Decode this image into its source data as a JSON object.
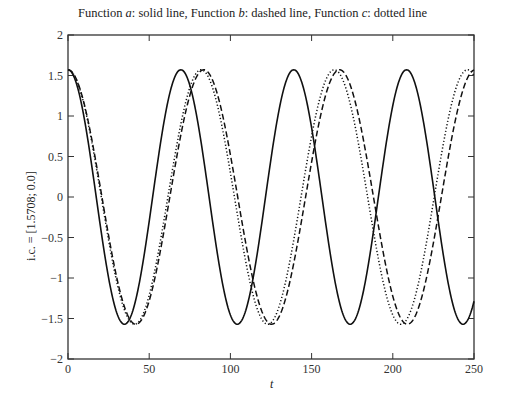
{
  "chart_data": {
    "type": "line",
    "title": "Function a: solid line, Function b: dashed line, Function c: dotted line",
    "title_parts": [
      "Function ",
      "a",
      ": solid line, Function ",
      "b",
      ": dashed line, Function ",
      "c",
      ": dotted line"
    ],
    "xlabel": "t",
    "ylabel": "i.c. = [1.5708; 0.0]",
    "xlim": [
      0,
      250
    ],
    "ylim": [
      -2,
      2
    ],
    "xticks": [
      0,
      50,
      100,
      150,
      200,
      250
    ],
    "yticks": [
      -2,
      -1.5,
      -1,
      -0.5,
      0,
      0.5,
      1,
      1.5,
      2
    ],
    "ytick_labels": [
      "−2",
      "−1.5",
      "−1",
      "−0.5",
      "0",
      "0.5",
      "1",
      "1.5",
      "2"
    ],
    "grid": false,
    "legend": "none (described in title)",
    "series": [
      {
        "name": "Function a",
        "style": "solid",
        "amplitude": 1.5708,
        "period": 69.5,
        "peaks_t": [
          0,
          71,
          140,
          209
        ],
        "troughs_t": [
          35,
          104,
          174,
          243
        ]
      },
      {
        "name": "Function b",
        "style": "dashed",
        "amplitude": 1.5708,
        "period": 83.6,
        "peaks_t": [
          0,
          84,
          167,
          250
        ],
        "troughs_t": [
          42,
          126,
          209
        ]
      },
      {
        "name": "Function c",
        "style": "dotted",
        "amplitude": 1.5708,
        "period": 82.0,
        "peaks_t": [
          0,
          82,
          164,
          246
        ],
        "troughs_t": [
          41,
          123,
          205
        ]
      }
    ]
  }
}
